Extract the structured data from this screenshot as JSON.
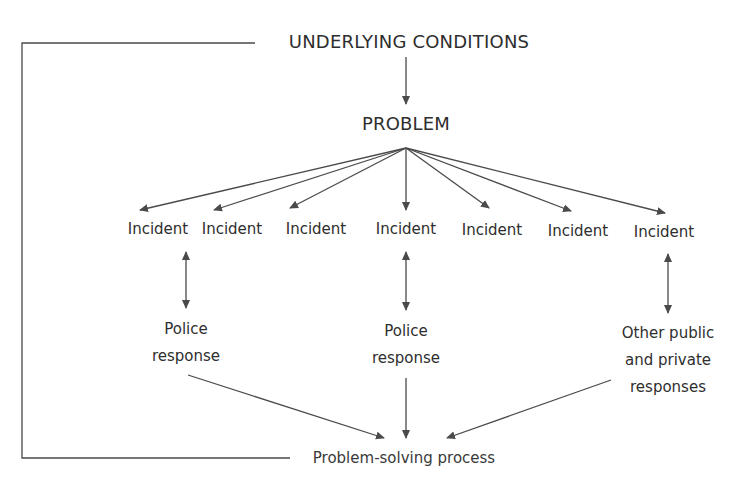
{
  "diagram": {
    "top_label": "UNDERLYING CONDITIONS",
    "problem_label": "PROBLEM",
    "incidents": [
      {
        "label": "Incident",
        "x": 158
      },
      {
        "label": "Incident",
        "x": 232
      },
      {
        "label": "Incident",
        "x": 316
      },
      {
        "label": "Incident",
        "x": 406
      },
      {
        "label": "Incident",
        "x": 492
      },
      {
        "label": "Incident",
        "x": 578
      },
      {
        "label": "Incident",
        "x": 664
      }
    ],
    "responses": [
      {
        "lines": [
          "Police",
          "response"
        ],
        "x": 186
      },
      {
        "lines": [
          "Police",
          "response"
        ],
        "x": 406
      },
      {
        "lines": [
          "Other public",
          "and private",
          "responses"
        ],
        "x": 668
      }
    ],
    "process_label": "Problem-solving process",
    "colors": {
      "line": "#4a4a4a",
      "text": "#2e2e2e",
      "background": "#ffffff"
    }
  }
}
